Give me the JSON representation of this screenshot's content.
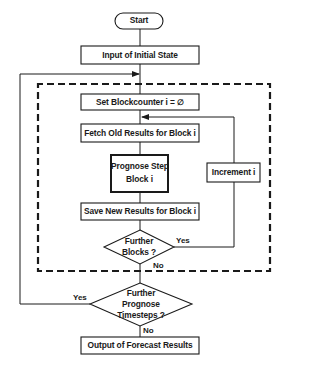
{
  "diagram": {
    "type": "flowchart",
    "colors": {
      "line": "#1a1a1a",
      "background": "#ffffff"
    },
    "nodes": {
      "start": {
        "label": "Start",
        "shape": "terminator"
      },
      "input": {
        "label": "Input of Initial State",
        "shape": "process"
      },
      "set_counter": {
        "label": "Set Blockcounter  i = ∅",
        "shape": "process"
      },
      "fetch": {
        "label": "Fetch Old Results for Block i",
        "shape": "process"
      },
      "prognose": {
        "line1": "Prognose Step",
        "line2": "Block  i",
        "shape": "process-emphasized"
      },
      "save": {
        "label": "Save New Results for Block i",
        "shape": "process"
      },
      "increment": {
        "label": "Increment i",
        "shape": "process"
      },
      "further_blocks": {
        "line1": "Further",
        "line2": "Blocks ?",
        "shape": "decision"
      },
      "further_timesteps": {
        "line1": "Further",
        "line2": "Prognose",
        "line3": "Timesteps ?",
        "shape": "decision"
      },
      "output": {
        "label": "Output of Forecast Results",
        "shape": "process"
      }
    },
    "edges": {
      "blocks_yes": "Yes",
      "blocks_no": "No",
      "timesteps_yes": "Yes",
      "timesteps_no": "No"
    },
    "groups": {
      "inner_loop": {
        "style": "dashed"
      }
    }
  }
}
